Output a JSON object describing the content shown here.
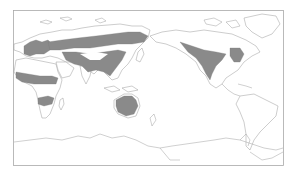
{
  "map": {
    "projection": "pacific-centered world map",
    "colors": {
      "background": "#ffffff",
      "land_fill": "#ffffff",
      "coastline": "#9a9a9a",
      "range_fill": "#8a8a8a",
      "frame": "#a8a8a8"
    },
    "regions_shaded": [
      "Europe",
      "Central Asia / Siberia belt",
      "South and East Asia",
      "Sahel (Africa)",
      "Southern Africa band",
      "Australia",
      "Western and Central North America",
      "Eastern North America"
    ]
  }
}
